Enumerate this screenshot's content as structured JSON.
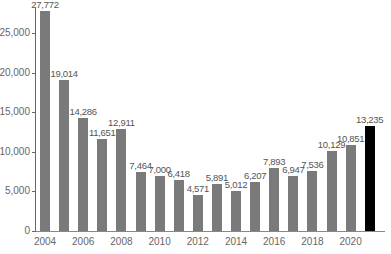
{
  "chart_data": {
    "type": "bar",
    "title": "",
    "xlabel": "",
    "ylabel": "",
    "ylim": [
      0,
      28000
    ],
    "yticks": [
      0,
      5000,
      10000,
      15000,
      20000,
      25000
    ],
    "ytick_labels": [
      "0",
      "5,000",
      "10,000",
      "15,000",
      "20,000",
      "25,000"
    ],
    "xtick_labels": [
      "2004",
      "2006",
      "2008",
      "2010",
      "2012",
      "2014",
      "2016",
      "2018",
      "2020"
    ],
    "categories": [
      "2004",
      "2005",
      "2006",
      "2007",
      "2008",
      "2009",
      "2010",
      "2011",
      "2012",
      "2013",
      "2014",
      "2015",
      "2016",
      "2017",
      "2018",
      "2019",
      "2020",
      "2021"
    ],
    "values": [
      27772,
      19014,
      14286,
      11651,
      12911,
      7464,
      7000,
      6418,
      4571,
      5891,
      5012,
      6207,
      7893,
      6947,
      7536,
      10129,
      10851,
      13235
    ],
    "value_labels": [
      "27,772",
      "19,014",
      "14,286",
      "11,651",
      "12,911",
      "7,464",
      "7,000",
      "6,418",
      "4,571",
      "5,891",
      "5,012",
      "6,207",
      "7,893",
      "6,947",
      "7,536",
      "10,129",
      "10,851",
      "13,235"
    ],
    "highlight_index": 17,
    "colors": {
      "bar": "#7a7a7a",
      "highlight": "#000000"
    },
    "grid": false,
    "legend": null
  }
}
